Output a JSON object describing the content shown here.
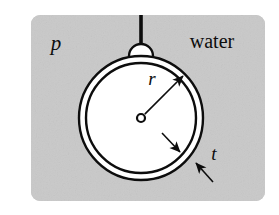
{
  "figure": {
    "background_color": "#ffffff",
    "panel_color": "#c9c9c9",
    "ink_color": "#0d0d0d",
    "interior_color": "#ffffff",
    "panel": {
      "x": 31,
      "y": 15,
      "width": 234,
      "height": 186,
      "corner_radius": 9
    },
    "sphere": {
      "center_x": 141,
      "center_y": 118,
      "outer_radius": 62,
      "inner_radius": 55,
      "stroke_width": 2.4
    },
    "hanger": {
      "rod_x": 141,
      "rod_top_y": 15,
      "rod_bottom_y": 44,
      "rod_width": 3.6,
      "loop_center_y": 56,
      "loop_radius": 12,
      "loop_stroke_width": 2.4
    },
    "radius_arrow": {
      "from_x": 141,
      "from_y": 118,
      "to_x": 183,
      "to_y": 76,
      "hub_radius": 4,
      "stroke_width": 1.6
    },
    "thickness_arrows": [
      {
        "from_x": 162,
        "from_y": 133,
        "to_x": 180,
        "to_y": 152,
        "stroke_width": 1.6
      },
      {
        "from_x": 213,
        "from_y": 182,
        "to_x": 196,
        "to_y": 163,
        "stroke_width": 1.6
      }
    ]
  },
  "labels": {
    "pressure": {
      "text": "p",
      "x": 56,
      "y": 50,
      "font_size": 21,
      "style": "italic",
      "meaning": "external-pressure-symbol"
    },
    "fluid": {
      "text": "water",
      "x": 212,
      "y": 48,
      "font_size": 20,
      "style": "normal",
      "meaning": "surrounding-fluid-name"
    },
    "radius": {
      "text": "r",
      "x": 152,
      "y": 85,
      "font_size": 19,
      "style": "italic",
      "meaning": "sphere-radius-symbol"
    },
    "thickness": {
      "text": "t",
      "x": 214,
      "y": 160,
      "font_size": 19,
      "style": "italic",
      "meaning": "wall-thickness-symbol"
    }
  }
}
